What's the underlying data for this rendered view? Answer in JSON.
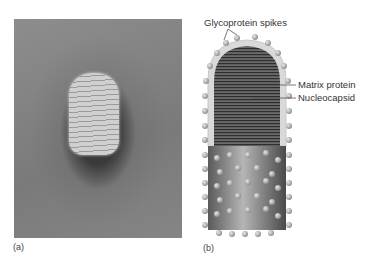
{
  "figure": {
    "panel_a": {
      "label": "(a)",
      "description": "electron micrograph of bullet-shaped virus particle"
    },
    "panel_b": {
      "label": "(b)",
      "callouts": {
        "spikes": "Glycoprotein spikes",
        "matrix": "Matrix protein",
        "nucleocapsid": "Nucleocapsid"
      }
    }
  }
}
